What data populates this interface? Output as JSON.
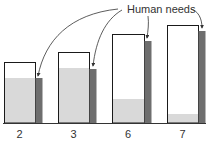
{
  "chart_data": {
    "type": "bar",
    "title": "",
    "xlabel": "",
    "ylabel": "",
    "categories": [
      "2",
      "3",
      "6",
      "7"
    ],
    "annotation": "Human needs",
    "series": [
      {
        "name": "Capacity (outlined box)",
        "values": [
          61,
          71,
          89,
          98
        ]
      },
      {
        "name": "Filled portion (light gray)",
        "values": [
          45,
          55,
          24,
          9
        ]
      },
      {
        "name": "Human needs (dark bar)",
        "values": [
          45,
          54,
          82,
          92
        ]
      }
    ],
    "units": "relative height (px above baseline)",
    "grid": false,
    "legend": "none"
  },
  "colors": {
    "box_outline": "#1a1a1a",
    "fill_light": "#d9d9d9",
    "needs_bar": "#6e6e6e",
    "axis": "#333333",
    "arrow": "#333333",
    "text": "#333333"
  },
  "layout": {
    "baseline_y": 123,
    "label_y": 138,
    "groups": [
      {
        "box_x": 4,
        "box_w": 31,
        "bar_w": 7
      },
      {
        "box_x": 58,
        "box_w": 31,
        "bar_w": 7
      },
      {
        "box_x": 112,
        "box_w": 32,
        "bar_w": 7
      },
      {
        "box_x": 167,
        "box_w": 31,
        "bar_w": 7
      }
    ]
  }
}
